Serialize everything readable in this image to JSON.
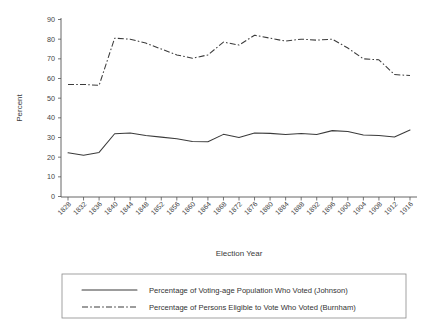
{
  "chart_data": {
    "type": "line",
    "title": "",
    "xlabel": "Election Year",
    "ylabel": "Percent",
    "ylim": [
      0,
      90
    ],
    "yticks": [
      0,
      10,
      20,
      30,
      40,
      50,
      60,
      70,
      80,
      90
    ],
    "grid": false,
    "legend_position": "bottom",
    "categories": [
      "1828",
      "1832",
      "1836",
      "1840",
      "1844",
      "1848",
      "1852",
      "1856",
      "1860",
      "1864",
      "1868",
      "1872",
      "1876",
      "1880",
      "1884",
      "1888",
      "1892",
      "1896",
      "1900",
      "1904",
      "1908",
      "1912",
      "1916"
    ],
    "series": [
      {
        "name": "Percentage of Voting-age Population Who Voted (Johnson)",
        "style": "solid",
        "values": [
          22.2,
          21.0,
          22.4,
          31.9,
          32.3,
          31.0,
          30.2,
          29.4,
          28.0,
          27.8,
          31.6,
          30.0,
          32.3,
          32.1,
          31.5,
          32.0,
          31.5,
          33.5,
          33.1,
          31.3,
          31.0,
          30.3,
          33.8
        ]
      },
      {
        "name": "Percentage of Persons Eligible to Vote Who Voted (Burnham)",
        "style": "dash-dot",
        "values": [
          57.0,
          57.0,
          56.5,
          80.5,
          80.0,
          78.0,
          75.0,
          72.0,
          70.3,
          72.0,
          78.5,
          77.0,
          82.0,
          80.5,
          79.0,
          80.0,
          79.5,
          80.0,
          75.5,
          70.0,
          69.5,
          62.0,
          61.5
        ]
      }
    ]
  },
  "axes": {
    "ylabel": "Percent",
    "xlabel": "Election Year"
  },
  "legend": {
    "items": [
      {
        "label": "Percentage of Voting-age Population Who Voted (Johnson)",
        "style": "solid",
        "swatch": "solid-line-swatch"
      },
      {
        "label": "Percentage of Persons Eligible to Vote Who Voted (Burnham)",
        "style": "dash-dot",
        "swatch": "dashdot-line-swatch"
      }
    ]
  }
}
